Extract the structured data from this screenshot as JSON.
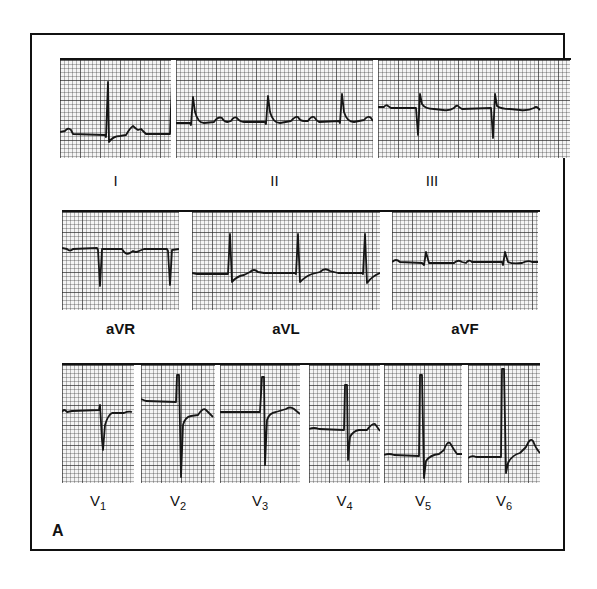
{
  "figure": {
    "panel_letter": "A",
    "rows": [
      {
        "name": "limb-leads",
        "leads": [
          {
            "id": "I",
            "label": "I"
          },
          {
            "id": "II",
            "label": "II"
          },
          {
            "id": "III",
            "label": "III"
          }
        ]
      },
      {
        "name": "augmented-leads",
        "leads": [
          {
            "id": "aVR",
            "label": "aVR"
          },
          {
            "id": "aVL",
            "label": "aVL"
          },
          {
            "id": "aVF",
            "label": "aVF"
          }
        ]
      },
      {
        "name": "precordial-leads",
        "leads": [
          {
            "id": "V1",
            "label": "V",
            "subscript": "1"
          },
          {
            "id": "V2",
            "label": "V",
            "subscript": "2"
          },
          {
            "id": "V3",
            "label": "V",
            "subscript": "3"
          },
          {
            "id": "V4",
            "label": "V",
            "subscript": "4"
          },
          {
            "id": "V5",
            "label": "V",
            "subscript": "5"
          },
          {
            "id": "V6",
            "label": "V",
            "subscript": "6"
          }
        ]
      }
    ],
    "colors": {
      "ink": "#111111",
      "grid_paper": "#f4f4f4",
      "background": "#ffffff"
    }
  }
}
